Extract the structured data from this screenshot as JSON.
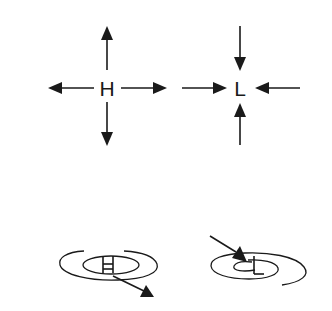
{
  "diagram": {
    "title": "",
    "colors": {
      "ink": "#1a1a1a",
      "background": "#ffffff"
    },
    "panels": [
      {
        "id": "high-pressure-divergence",
        "label": "H",
        "description": "Air flows outward from high pressure center",
        "arrows": [
          "up",
          "down",
          "left",
          "right"
        ],
        "arrow_direction": "outward"
      },
      {
        "id": "low-pressure-convergence",
        "label": "L",
        "description": "Air flows inward toward low pressure center",
        "arrows": [
          "from-top",
          "from-bottom",
          "from-left",
          "from-right"
        ],
        "arrow_direction": "inward"
      },
      {
        "id": "high-pressure-spiral",
        "label": "H",
        "description": "Spiral outflow from high, arrow leaving toward lower right",
        "arrow_direction": "outward"
      },
      {
        "id": "low-pressure-spiral",
        "label": "L",
        "description": "Spiral inflow to low, arrow entering from upper left",
        "arrow_direction": "inward"
      }
    ]
  }
}
